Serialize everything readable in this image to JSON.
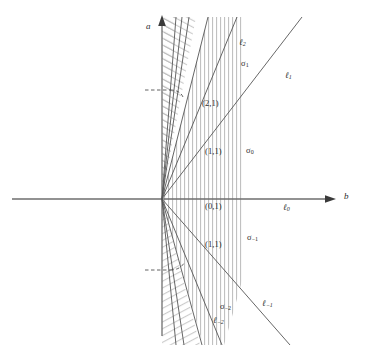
{
  "figure": {
    "title": "",
    "background_color": "#ffffff",
    "axis_color": "#6e6e6e",
    "line_color": "#555555",
    "hatch_color": "#aaaaaa",
    "label_color": "#2b2b2b",
    "axes": {
      "vertical": {
        "name": "a",
        "arrow": "up"
      },
      "horizontal": {
        "name": "b",
        "arrow": "right"
      },
      "origin": {
        "x": 162,
        "y": 199
      }
    },
    "line_labels": [
      {
        "id": "ell-2",
        "base": "ℓ",
        "sub": "2",
        "x": 239,
        "y": 42
      },
      {
        "id": "ell-1",
        "base": "ℓ",
        "sub": "1",
        "x": 285,
        "y": 75
      },
      {
        "id": "ell-0",
        "base": "ℓ",
        "sub": "0",
        "x": 283,
        "y": 202
      },
      {
        "id": "ell-m1",
        "base": "ℓ",
        "sub": "−1",
        "x": 263,
        "y": 303
      },
      {
        "id": "ell-m2",
        "base": "ℓ",
        "sub": "−2",
        "x": 216,
        "y": 318
      }
    ],
    "sector_labels": [
      {
        "id": "sigma-1",
        "base": "σ",
        "sub": "1",
        "x": 242,
        "y": 62
      },
      {
        "id": "sigma-0",
        "base": "σ",
        "sub": "0",
        "x": 247,
        "y": 149
      },
      {
        "id": "sigma-m1",
        "base": "σ",
        "sub": "−1",
        "x": 248,
        "y": 236
      },
      {
        "id": "sigma-m2",
        "base": "σ",
        "sub": "−2",
        "x": 222,
        "y": 305
      }
    ],
    "point_labels": [
      {
        "id": "pair-2-1",
        "text": "(2,1)",
        "x": 204,
        "y": 102
      },
      {
        "id": "pair-1-1-up",
        "text": "(1,1)",
        "x": 207,
        "y": 150
      },
      {
        "id": "pair-0-1",
        "text": "(0,1)",
        "x": 207,
        "y": 205
      },
      {
        "id": "pair-1-1-dn",
        "text": "(1,1)",
        "x": 207,
        "y": 243
      }
    ],
    "rays": [
      {
        "id": "ray-upper-a",
        "slope_dx": 14,
        "slope_dy": -182
      },
      {
        "id": "ray-upper-b",
        "slope_dx": 20,
        "slope_dy": -182
      },
      {
        "id": "ray-upper-c",
        "slope_dx": 27,
        "slope_dy": -182
      },
      {
        "id": "ray-ell2",
        "slope_dx": 46,
        "slope_dy": -182
      },
      {
        "id": "ray-21",
        "slope_dx": 75,
        "slope_dy": -182
      },
      {
        "id": "ray-ell1",
        "slope_dx": 140,
        "slope_dy": -182
      },
      {
        "id": "ray-lower-a",
        "slope_dx": 14,
        "slope_dy": 146
      },
      {
        "id": "ray-lower-b",
        "slope_dx": 22,
        "slope_dy": 146
      },
      {
        "id": "ray-ell-m2",
        "slope_dx": 40,
        "slope_dy": 146
      },
      {
        "id": "ray-11-down",
        "slope_dx": 60,
        "slope_dy": 146
      },
      {
        "id": "ray-ell-m1",
        "slope_dx": 128,
        "slope_dy": 146
      }
    ],
    "guides": [
      {
        "id": "dash-upper",
        "x1": 146,
        "y": 90,
        "x2": 178
      },
      {
        "id": "dash-lower",
        "x1": 146,
        "y": 270,
        "x2": 178
      }
    ],
    "hatch_regions": [
      {
        "id": "vertical-hatch",
        "style": "vertical",
        "note": "central wedge"
      },
      {
        "id": "diagonal-hatch-top",
        "style": "diagonal",
        "note": "upper-left wedge"
      },
      {
        "id": "diagonal-hatch-bottom",
        "style": "diagonal",
        "note": "lower-left wedge"
      }
    ]
  }
}
